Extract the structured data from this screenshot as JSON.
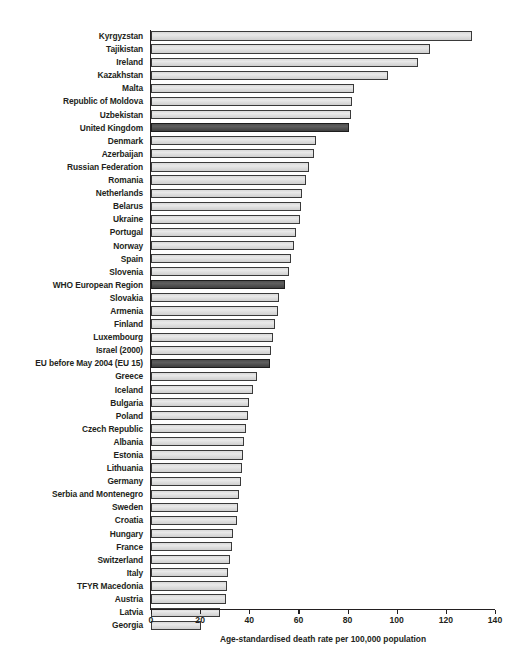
{
  "chart_data": {
    "type": "bar",
    "orientation": "horizontal",
    "title": "",
    "subtitle": "",
    "xlabel": "Age-standardised death rate per 100,000 population",
    "ylabel": "",
    "xlim": [
      0,
      140
    ],
    "xticks": [
      0,
      20,
      40,
      60,
      80,
      100,
      120,
      140
    ],
    "xtick_labels": [
      "0",
      "20",
      "40",
      "60",
      "80",
      "100",
      "120",
      "140"
    ],
    "grid": false,
    "legend": null,
    "highlight_color": "#4f4f4f",
    "bar_color": "#d9d9d9",
    "bar_edge_color": "#3a3a3a",
    "categories": [
      "Kyrgyzstan",
      "Tajikistan",
      "Ireland",
      "Kazakhstan",
      "Malta",
      "Republic of Moldova",
      "Uzbekistan",
      "United Kingdom",
      "Denmark",
      "Azerbaijan",
      "Russian Federation",
      "Romania",
      "Netherlands",
      "Belarus",
      "Ukraine",
      "Portugal",
      "Norway",
      "Spain",
      "Slovenia",
      "WHO European Region",
      "Slovakia",
      "Armenia",
      "Finland",
      "Luxembourg",
      "Israel (2000)",
      "EU before May 2004 (EU 15)",
      "Greece",
      "Iceland",
      "Bulgaria",
      "Poland",
      "Czech Republic",
      "Albania",
      "Estonia",
      "Lithuania",
      "Germany",
      "Serbia and Montenegro",
      "Sweden",
      "Croatia",
      "Hungary",
      "France",
      "Switzerland",
      "Italy",
      "TFYR Macedonia",
      "Austria",
      "Latvia",
      "Georgia"
    ],
    "values": [
      130.5,
      113.5,
      108.5,
      96.5,
      82.5,
      82.0,
      81.5,
      80.5,
      67.0,
      66.5,
      64.5,
      63.0,
      61.5,
      61.0,
      60.5,
      59.0,
      58.0,
      57.0,
      56.0,
      54.5,
      52.0,
      51.5,
      50.5,
      49.5,
      49.0,
      48.5,
      43.0,
      41.5,
      40.0,
      39.5,
      38.5,
      38.0,
      37.5,
      37.0,
      36.5,
      36.0,
      35.5,
      35.0,
      33.5,
      33.0,
      32.0,
      31.5,
      31.0,
      30.5,
      28.0,
      20.5
    ],
    "highlighted_categories": [
      "United Kingdom",
      "WHO European Region",
      "EU before May 2004 (EU 15)"
    ]
  }
}
